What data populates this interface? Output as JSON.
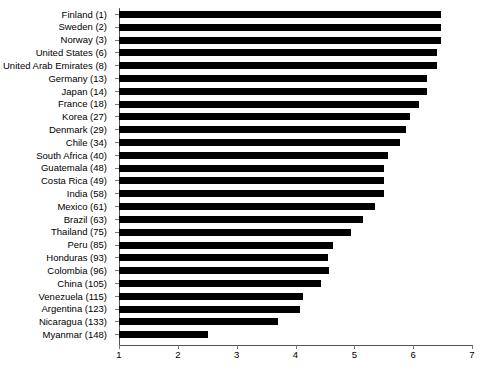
{
  "chart_data": {
    "type": "bar",
    "orientation": "horizontal",
    "title": "",
    "subtitle": "",
    "xlabel": "",
    "ylabel": "",
    "xlim": [
      1,
      7
    ],
    "xticks": [
      1,
      2,
      3,
      4,
      5,
      6,
      7
    ],
    "grid": false,
    "legend": null,
    "bar_color": "#000000",
    "axis_color": "#555555",
    "categories": [
      "Finland (1)",
      "Sweden (2)",
      "Norway (3)",
      "United States (6)",
      "United Arab Emirates (8)",
      "Germany (13)",
      "Japan (14)",
      "France (18)",
      "Korea (27)",
      "Denmark (29)",
      "Chile (34)",
      "South Africa (40)",
      "Guatemala (48)",
      "Costa Rica (49)",
      "India (58)",
      "Mexico (61)",
      "Brazil (63)",
      "Thailand (75)",
      "Peru (85)",
      "Honduras (93)",
      "Colombia (96)",
      "China (105)",
      "Venezuela (115)",
      "Argentina (123)",
      "Nicaragua (133)",
      "Myanmar (148)"
    ],
    "values": [
      6.47,
      6.47,
      6.47,
      6.4,
      6.4,
      6.23,
      6.23,
      6.1,
      5.95,
      5.87,
      5.78,
      5.58,
      5.5,
      5.5,
      5.5,
      5.35,
      5.15,
      4.95,
      4.63,
      4.55,
      4.57,
      4.43,
      4.12,
      4.08,
      3.7,
      2.52
    ]
  }
}
